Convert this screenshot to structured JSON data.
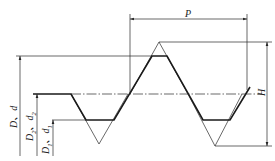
{
  "labels": {
    "pitch": "P",
    "height": "H",
    "major_diameter": {
      "main": "D",
      "sep": "、",
      "var": "d"
    },
    "pitch_diameter": {
      "main": "D",
      "sub": "2",
      "sep": "、",
      "var": "d",
      "var_sub": "2"
    },
    "minor_diameter": {
      "main": "D",
      "sub": "1",
      "sep": "、",
      "var": "d",
      "var_sub": "1"
    }
  },
  "colors": {
    "line": "#1a1a1a",
    "background": "#ffffff"
  }
}
